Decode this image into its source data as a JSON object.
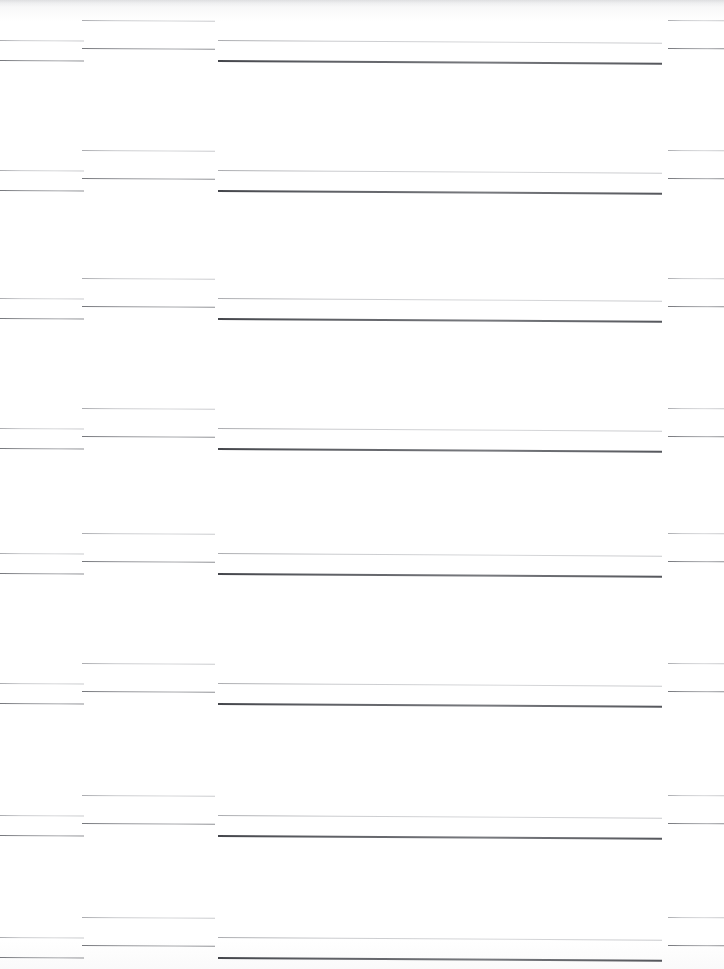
{
  "document": {
    "kind": "scanned-page",
    "page_width": 724,
    "page_height": 969,
    "background_color": "#fdfdfd",
    "ink_color": "#3a3c42",
    "description": "Degraded scan of a ruled document page. No legible text remains; only horizontal rule segments survive, arranged in four vertical column bands repeating in eight row groups.",
    "visible_text": ""
  },
  "columns": [
    {
      "id": "col-1",
      "name": "left-margin-column",
      "x": 0,
      "width": 84
    },
    {
      "id": "col-2",
      "name": "label-column",
      "x": 82,
      "width": 133
    },
    {
      "id": "col-3",
      "name": "main-body-column",
      "x": 218,
      "width": 444
    },
    {
      "id": "col-4",
      "name": "right-margin-column",
      "x": 668,
      "width": 56
    }
  ],
  "row_groups": [
    {
      "id": "group-1",
      "top": 14,
      "name": "entry-block-1"
    },
    {
      "id": "group-2",
      "top": 144,
      "name": "entry-block-2"
    },
    {
      "id": "group-3",
      "top": 272,
      "name": "entry-block-3"
    },
    {
      "id": "group-4",
      "top": 402,
      "name": "entry-block-4"
    },
    {
      "id": "group-5",
      "top": 527,
      "name": "entry-block-5"
    },
    {
      "id": "group-6",
      "top": 657,
      "name": "entry-block-6"
    },
    {
      "id": "group-7",
      "top": 789,
      "name": "entry-block-7"
    },
    {
      "id": "group-8",
      "top": 911,
      "name": "entry-block-8"
    }
  ],
  "group_pattern": {
    "description": "Within each row group the four columns carry rules at four staggered sub-rows.",
    "sub_rows": [
      {
        "dy": 6,
        "weight": "light"
      },
      {
        "dy": 26,
        "weight": "light"
      },
      {
        "dy": 34,
        "weight": "medium"
      },
      {
        "dy": 46,
        "weight": "heavy"
      }
    ],
    "column_occupancy": {
      "col-1": [
        {
          "dy": 26,
          "weight": "light"
        },
        {
          "dy": 46,
          "weight": "medium"
        }
      ],
      "col-2": [
        {
          "dy": 6,
          "weight": "light"
        },
        {
          "dy": 34,
          "weight": "medium"
        }
      ],
      "col-3": [
        {
          "dy": 26,
          "weight": "light"
        },
        {
          "dy": 46,
          "weight": "heavy"
        }
      ],
      "col-4": [
        {
          "dy": 6,
          "weight": "light"
        },
        {
          "dy": 34,
          "weight": "medium"
        }
      ]
    }
  }
}
